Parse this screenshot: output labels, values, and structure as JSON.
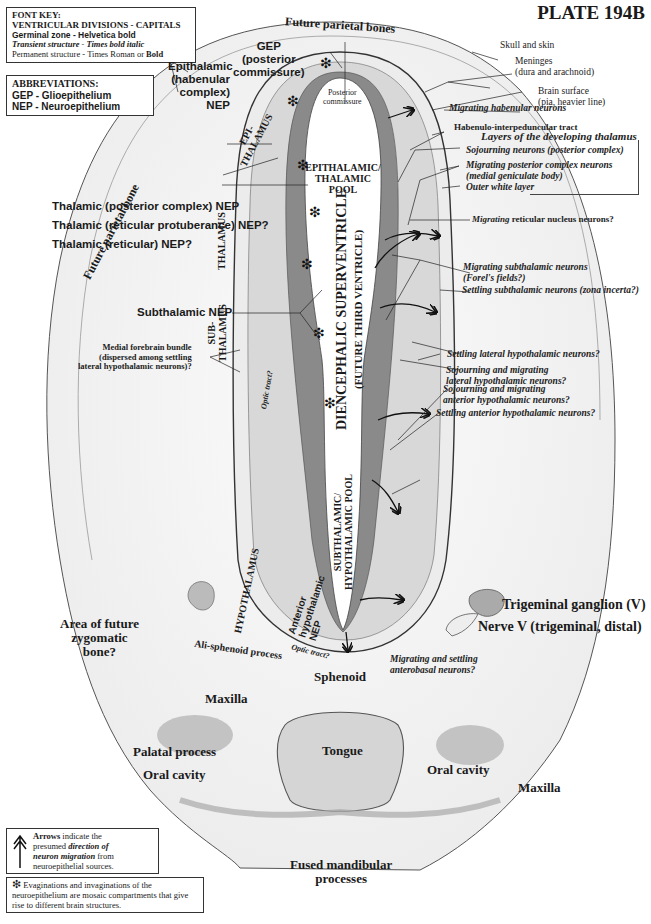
{
  "plate": {
    "title": "PLATE 194B"
  },
  "font_key": {
    "heading": "FONT KEY:",
    "lines": [
      "VENTRICULAR DIVISIONS  -  CAPITALS",
      "Germinal zone - Helvetica bold",
      "Transient structure - Times bold italic",
      "Permanent structure - Times Roman or ",
      "Bold"
    ]
  },
  "abbreviations": {
    "heading": "ABBREVIATIONS:",
    "items": [
      "GEP - Glioepithelium",
      "NEP - Neuroepithelium"
    ]
  },
  "labels_top": {
    "future_parietal_bones": "Future parietal bones",
    "future_parietal_bone_left": "Future parietal bone",
    "skull_and_skin": "Skull and skin",
    "meninges": [
      "Meninges",
      "(dura and arachnoid)"
    ],
    "brain_surface": [
      "Brain surface",
      "(pia, heavier line)"
    ]
  },
  "germinal_zones": {
    "gep_posterior_commissure": [
      "GEP",
      "(posterior",
      "commissure)"
    ],
    "epithalamic_nep": [
      "Epithalamic",
      "(habenular",
      "complex)",
      "NEP"
    ],
    "thalamic_posterior_complex_nep": "Thalamic (posterior complex) NEP",
    "thalamic_reticular_protuberance_nep": "Thalamic (reticular protuberance) NEP?",
    "thalamic_reticular_nep": "Thalamic (reticular) NEP?",
    "subthalamic_nep": "Subthalamic NEP",
    "anterior_hypothalamic_nep": [
      "Anterior",
      "hypothalamic",
      "NEP"
    ]
  },
  "ventricular_divisions": {
    "epithalamus": [
      "EPI-",
      "THALAMUS"
    ],
    "thalamus": "THALAMUS",
    "subthalamus": [
      "SUB-",
      "THALAMUS"
    ],
    "hypothalamus": "HYPOTHALAMUS",
    "epithalamic_thalamic_pool": [
      "EPITHALAMIC/",
      "THALAMIC",
      "POOL"
    ],
    "superventricle": "DIENCEPHALIC SUPERVENTRICLE",
    "superventricle_sub": "(FUTURE THIRD VENTRICLE)",
    "subthalamic_hypothalamic_pool": [
      "SUBTHALAMIC/",
      "HYPOTHALAMIC POOL"
    ]
  },
  "permanent_structures": {
    "posterior_commissure": [
      "Posterior",
      "commissure"
    ],
    "habenulo_interpeduncular_tract": "Habenulo-interpeduncular tract",
    "migrating_reticular_prefix": "Migrating",
    "migrating_reticular_rest": " reticular nucleus neurons?",
    "medial_forebrain_bundle": [
      "Medial forebrain bundle",
      "(dispersed among settling",
      "lateral hypothalamic neurons)?"
    ],
    "area_zygomatic": [
      "Area of future",
      "zygomatic",
      "bone?"
    ],
    "ali_sphenoid": "Ali-sphenoid process",
    "sphenoid": "Sphenoid",
    "maxilla_left": "Maxilla",
    "maxilla_right": "Maxilla",
    "palatal_process": "Palatal process",
    "oral_cavity_left": "Oral cavity",
    "oral_cavity_right": "Oral cavity",
    "tongue": "Tongue",
    "trigeminal_ganglion": "Trigeminal ganglion (V)",
    "nerve_v": "Nerve V (trigeminal, distal)",
    "fused_mandibular": [
      "Fused mandibular",
      "processes"
    ]
  },
  "transient_structures": {
    "migrating_habenular": "Migrating habenular neurons",
    "layers_heading": "Layers of the developing thalamus",
    "sojourning_posterior": "Sojourning neurons (posterior complex)",
    "migrating_posterior": [
      "Migrating posterior complex neurons",
      "(medial geniculate body)"
    ],
    "outer_white_layer": "Outer white layer",
    "migrating_subthalamic": [
      "Migrating subthalamic neurons",
      "(Forel's fields?)"
    ],
    "settling_subthalamic": "Settling subthalamic neurons (zona incerta?)",
    "settling_lateral_hypothalamic": "Settling lateral hypothalamic neurons?",
    "sojourning_lateral_hypothalamic": [
      "Sojourning and migrating",
      "lateral hypothalamic neurons?"
    ],
    "sojourning_anterior_hypothalamic": [
      "Sojourning and migrating",
      "anterior hypothalamic neurons?"
    ],
    "settling_anterior_hypothalamic": "Settling anterior hypothalamic neurons?",
    "optic_tract_1": "Optic tract?",
    "optic_tract_2": "Optic tract?",
    "migrating_anterobasal": [
      "Migrating and settling",
      "anterobasal neurons?"
    ]
  },
  "legend_arrows": {
    "bold": "Arrows",
    "t1": " indicate the",
    "t2": "presumed ",
    "italic1": "direction of",
    "italic2": "neuron migration",
    "t3": " from",
    "t4": "neuroepithelial sources."
  },
  "legend_asterisk": {
    "symbol": "❇",
    "text": "Evaginations and invaginations of the neuroepithelium are mosaic compartments that give rise to different brain structures."
  },
  "colors": {
    "ink": "#1a1a1a",
    "neuroepithelium": "#7a7a7a",
    "tissue_light": "#d9d9d9",
    "tissue_mid": "#bdbdbd",
    "background": "#ffffff"
  }
}
